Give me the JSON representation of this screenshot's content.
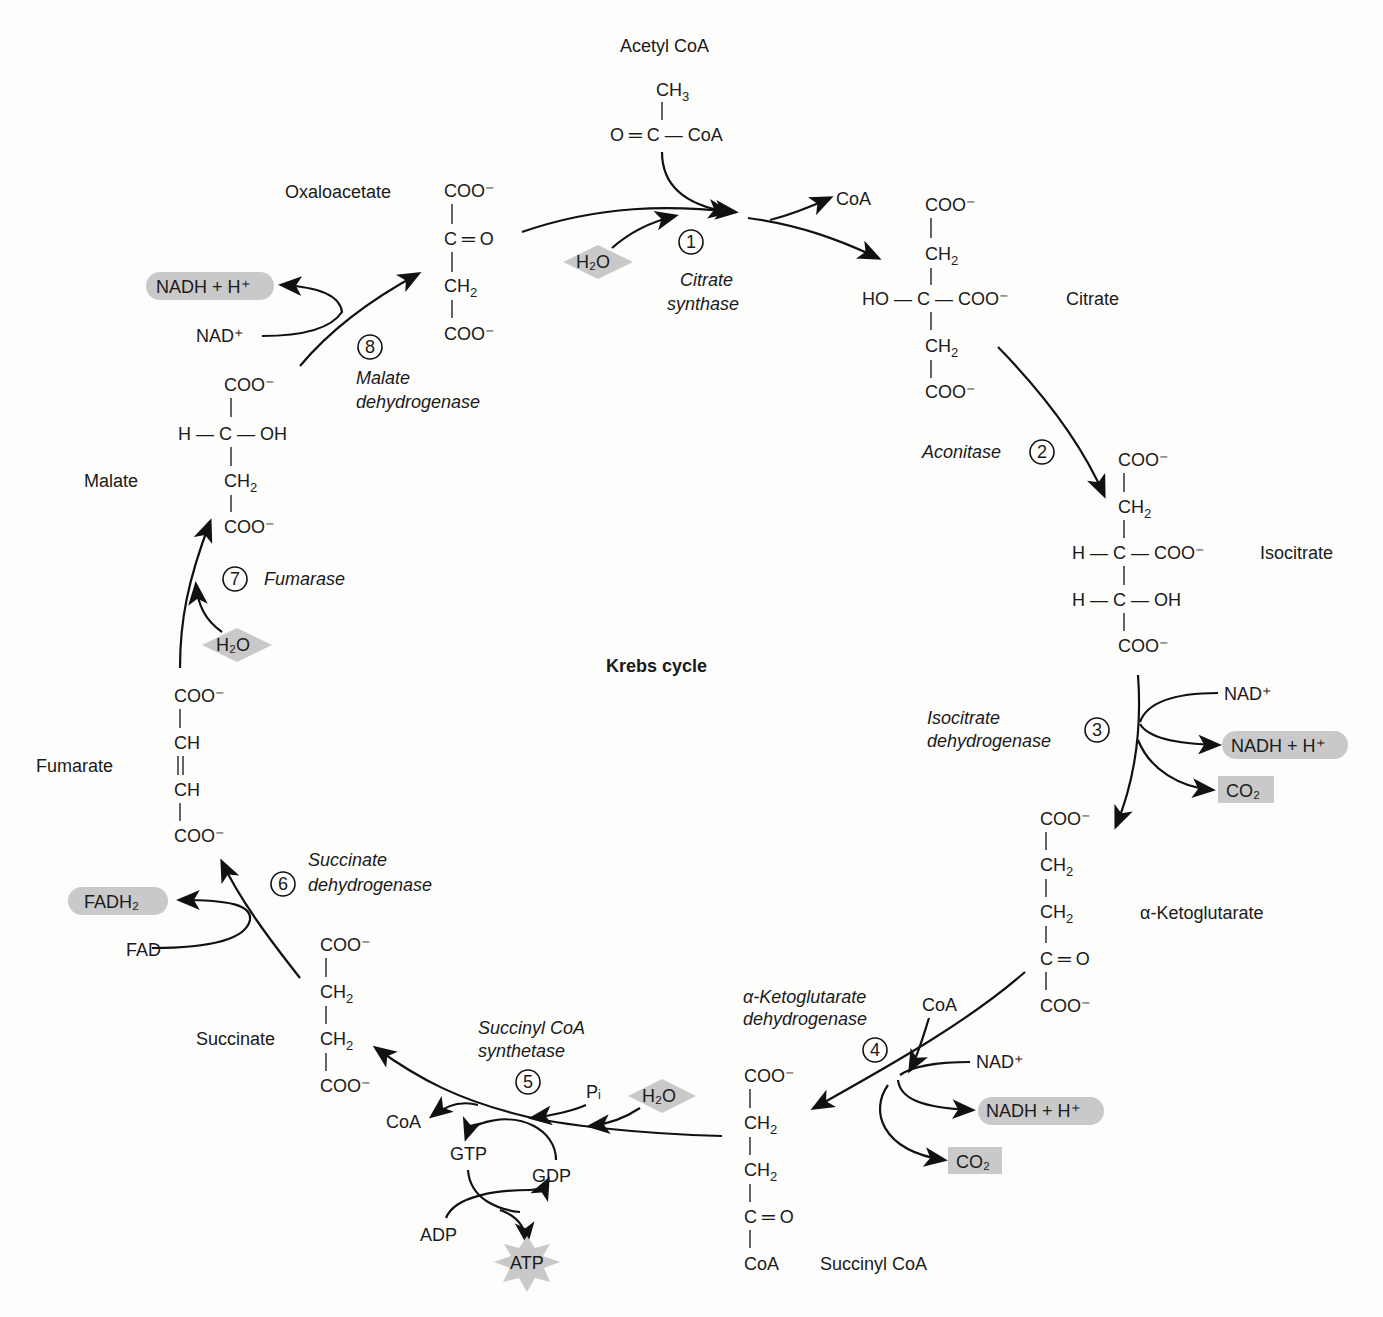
{
  "title": "Krebs cycle",
  "caption_fragment": "…6-17 Overview of the Krebs cycle",
  "colors": {
    "cofactor_fill": "#c9c9c9",
    "line": "#111111",
    "background": "#fdfdfb"
  },
  "molecules": {
    "acetyl_coa": {
      "name": "Acetyl CoA",
      "ch3": "CH",
      "ch3_sub": "3",
      "row": "O ═ C — CoA"
    },
    "oxaloacetate": {
      "name": "Oxaloacetate",
      "l1": "COO⁻",
      "l2": "C ═ O",
      "l3": "CH",
      "l3_sub": "2",
      "l4": "COO⁻"
    },
    "citrate": {
      "name": "Citrate",
      "l1": "COO⁻",
      "l2": "CH",
      "l2_sub": "2",
      "l3": "HO — C — COO⁻",
      "l4": "CH",
      "l4_sub": "2",
      "l5": "COO⁻"
    },
    "isocitrate": {
      "name": "Isocitrate",
      "l1": "COO⁻",
      "l2": "CH",
      "l2_sub": "2",
      "l3": "H — C — COO⁻",
      "l4": "H — C — OH",
      "l5": "COO⁻"
    },
    "alpha_ketoglutarate": {
      "name": "α-Ketoglutarate",
      "l1": "COO⁻",
      "l2": "CH",
      "l2_sub": "2",
      "l3": "CH",
      "l3_sub": "2",
      "l4": "C ═ O",
      "l5": "COO⁻"
    },
    "succinyl_coa": {
      "name": "Succinyl CoA",
      "l1": "COO⁻",
      "l2": "CH",
      "l2_sub": "2",
      "l3": "CH",
      "l3_sub": "2",
      "l4": "C ═ O",
      "l5": "CoA"
    },
    "succinate": {
      "name": "Succinate",
      "l1": "COO⁻",
      "l2": "CH",
      "l2_sub": "2",
      "l3": "CH",
      "l3_sub": "2",
      "l4": "COO⁻"
    },
    "fumarate": {
      "name": "Fumarate",
      "l1": "COO⁻",
      "l2": "CH",
      "l3": "CH",
      "l4": "COO⁻"
    },
    "malate": {
      "name": "Malate",
      "l1": "COO⁻",
      "l2": "H — C — OH",
      "l3": "CH",
      "l3_sub": "2",
      "l4": "COO⁻"
    }
  },
  "steps": [
    {
      "num": "1",
      "enzyme_l1": "Citrate",
      "enzyme_l2": "synthase"
    },
    {
      "num": "2",
      "enzyme_l1": "Aconitase",
      "enzyme_l2": ""
    },
    {
      "num": "3",
      "enzyme_l1": "Isocitrate",
      "enzyme_l2": "dehydrogenase"
    },
    {
      "num": "4",
      "enzyme_l1": "α-Ketoglutarate",
      "enzyme_l2": "dehydrogenase"
    },
    {
      "num": "5",
      "enzyme_l1": "Succinyl CoA",
      "enzyme_l2": "synthetase"
    },
    {
      "num": "6",
      "enzyme_l1": "Succinate",
      "enzyme_l2": "dehydrogenase"
    },
    {
      "num": "7",
      "enzyme_l1": "Fumarase",
      "enzyme_l2": ""
    },
    {
      "num": "8",
      "enzyme_l1": "Malate",
      "enzyme_l2": "dehydrogenase"
    }
  ],
  "cofactors": {
    "s1_h2o": "H₂O",
    "s1_coa": "CoA",
    "s3_nad": "NAD⁺",
    "s3_nadh": "NADH + H⁺",
    "s3_co2": "CO₂",
    "s4_coa": "CoA",
    "s4_nad": "NAD⁺",
    "s4_nadh": "NADH + H⁺",
    "s4_co2": "CO₂",
    "s5_pi": "Pᵢ",
    "s5_h2o": "H₂O",
    "s5_coa": "CoA",
    "s5_gtp": "GTP",
    "s5_gdp": "GDP",
    "s5_adp": "ADP",
    "s5_atp": "ATP",
    "s6_fad": "FAD",
    "s6_fadh2": "FADH₂",
    "s7_h2o": "H₂O",
    "s8_nad": "NAD⁺",
    "s8_nadh": "NADH + H⁺"
  }
}
